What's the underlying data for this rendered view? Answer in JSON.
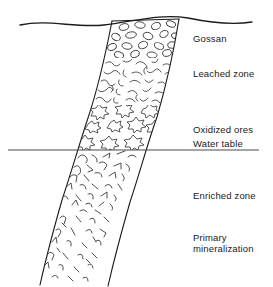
{
  "figure": {
    "type": "geological-cross-section",
    "width": 273,
    "height": 287,
    "background_color": "#ffffff",
    "line_color": "#1a1a1a",
    "texture_color": "#3a3a3a"
  },
  "labels": {
    "gossan": "Gossan",
    "leached_zone": "Leached zone",
    "oxidized_ores": "Oxidized ores",
    "water_table": "Water table",
    "enriched_zone": "Enriched zone",
    "primary_line1": "Primary",
    "primary_line2": "mineralization"
  },
  "label_positions": {
    "gossan": {
      "x": 193,
      "y": 33
    },
    "leached_zone": {
      "x": 193,
      "y": 68
    },
    "oxidized_ores": {
      "x": 193,
      "y": 124
    },
    "water_table": {
      "x": 193,
      "y": 143
    },
    "enriched_zone": {
      "x": 193,
      "y": 190
    },
    "primary": {
      "x": 193,
      "y": 232
    }
  },
  "features": {
    "ground_surface": {
      "name": "ground-surface-line",
      "description": "wavy topographic surface line",
      "path": "M 20 25 C 48 19, 74 28, 104 25 C 132 22, 160 13, 188 18 C 212 23, 234 25, 252 22"
    },
    "water_table_line": {
      "name": "water-table-line",
      "description": "horizontal straight line marking water table",
      "x1": 8,
      "y1": 150,
      "x2": 259,
      "y2": 150
    },
    "vein_left_boundary": {
      "name": "vein-left-edge",
      "path": "M 112 21 C 106 52, 98 88, 88 118 C 80 142, 72 170, 62 200 C 54 228, 46 258, 40 285"
    },
    "vein_right_boundary": {
      "name": "vein-right-edge",
      "path": "M 179 19 C 174 50, 166 86, 157 117 C 148 142, 140 172, 130 202 C 122 230, 114 260, 108 286"
    }
  },
  "zones": [
    {
      "id": "gossan",
      "label": "Gossan",
      "texture": "ellipses",
      "y_range": [
        21,
        58
      ],
      "description": "oval/ellipse boxwork texture"
    },
    {
      "id": "leached",
      "label": "Leached zone",
      "texture": "squiggles",
      "y_range": [
        58,
        105
      ],
      "description": "dense short branching squiggle marks"
    },
    {
      "id": "oxidized",
      "label": "Oxidized ores",
      "texture": "stars",
      "y_range": [
        105,
        150
      ],
      "description": "star / burst shaped crystal symbols"
    },
    {
      "id": "enriched",
      "label": "Enriched zone",
      "texture": "hooks-dense",
      "y_range": [
        150,
        215
      ],
      "description": "dense hooked and angular tick marks"
    },
    {
      "id": "primary",
      "label": "Primary mineralization",
      "texture": "hooks-sparse",
      "y_range": [
        215,
        287
      ],
      "description": "sparse scattered hooked tick marks"
    }
  ]
}
